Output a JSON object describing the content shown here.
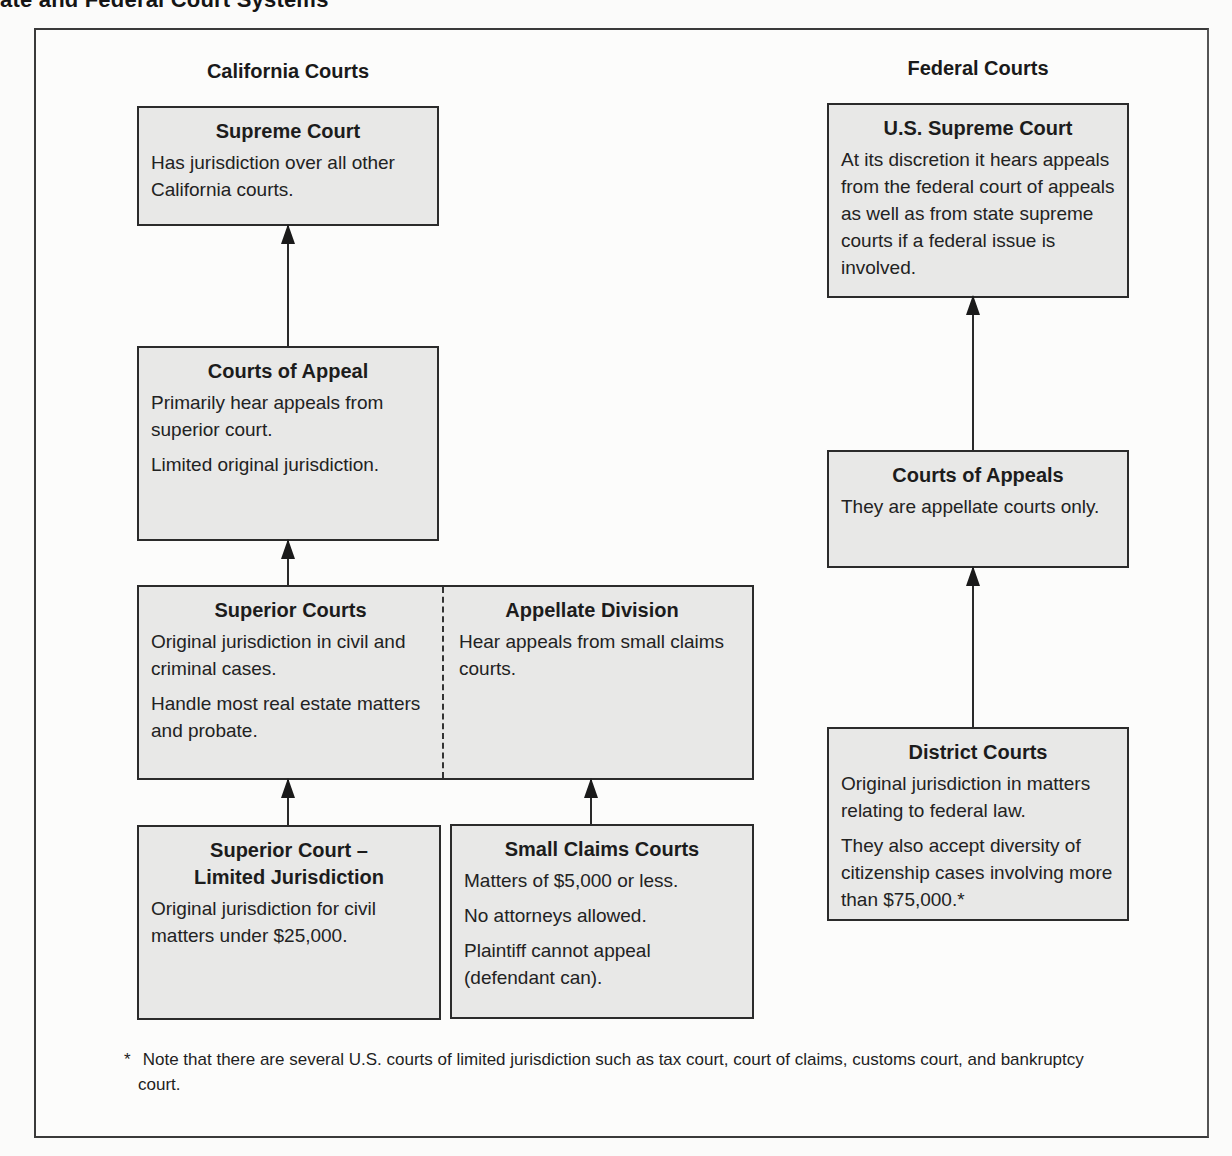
{
  "page": {
    "visible_title_fragment": "ate and Federal Court Systems"
  },
  "california": {
    "heading": "California Courts",
    "supreme_court": {
      "title": "Supreme Court",
      "lines": [
        "Has jurisdiction over all other California courts."
      ]
    },
    "courts_of_appeal": {
      "title": "Courts of Appeal",
      "lines": [
        "Primarily hear appeals from superior court.",
        "Limited original jurisdiction."
      ]
    },
    "superior_courts": {
      "title": "Superior Courts",
      "lines": [
        "Original jurisdiction in civil and criminal cases.",
        "Handle most real estate matters and probate."
      ]
    },
    "appellate_division": {
      "title": "Appellate Division",
      "lines": [
        "Hear appeals from small claims courts."
      ]
    },
    "limited_jurisdiction": {
      "title_line1": "Superior Court –",
      "title_line2": "Limited Jurisdiction",
      "lines": [
        "Original jurisdiction for civil matters under $25,000."
      ]
    },
    "small_claims": {
      "title": "Small Claims Courts",
      "lines": [
        "Matters of $5,000 or less.",
        "No attorneys allowed.",
        "Plaintiff cannot appeal (defendant can)."
      ]
    }
  },
  "federal": {
    "heading": "Federal Courts",
    "us_supreme_court": {
      "title": "U.S. Supreme Court",
      "lines": [
        "At its discretion it hears appeals from the federal court of appeals as well as from state supreme courts if a federal issue is involved."
      ]
    },
    "courts_of_appeals": {
      "title": "Courts of Appeals",
      "lines": [
        "They are appellate courts only."
      ]
    },
    "district_courts": {
      "title": "District Courts",
      "lines": [
        "Original jurisdiction in matters relating to federal law.",
        "They also accept diversity of citizenship cases involving more than $75,000.*"
      ]
    }
  },
  "footnote": {
    "marker": "*",
    "text": "Note that there are several U.S. courts of limited jurisdiction such as tax court, court of claims, customs court, and bankruptcy court."
  },
  "arrows": [
    {
      "from": "courts_of_appeal",
      "to": "supreme_court"
    },
    {
      "from": "superior_courts",
      "to": "courts_of_appeal"
    },
    {
      "from": "limited_jurisdiction",
      "to": "superior_courts"
    },
    {
      "from": "small_claims",
      "to": "appellate_division"
    },
    {
      "from": "courts_of_appeals",
      "to": "us_supreme_court"
    },
    {
      "from": "district_courts",
      "to": "courts_of_appeals"
    }
  ]
}
